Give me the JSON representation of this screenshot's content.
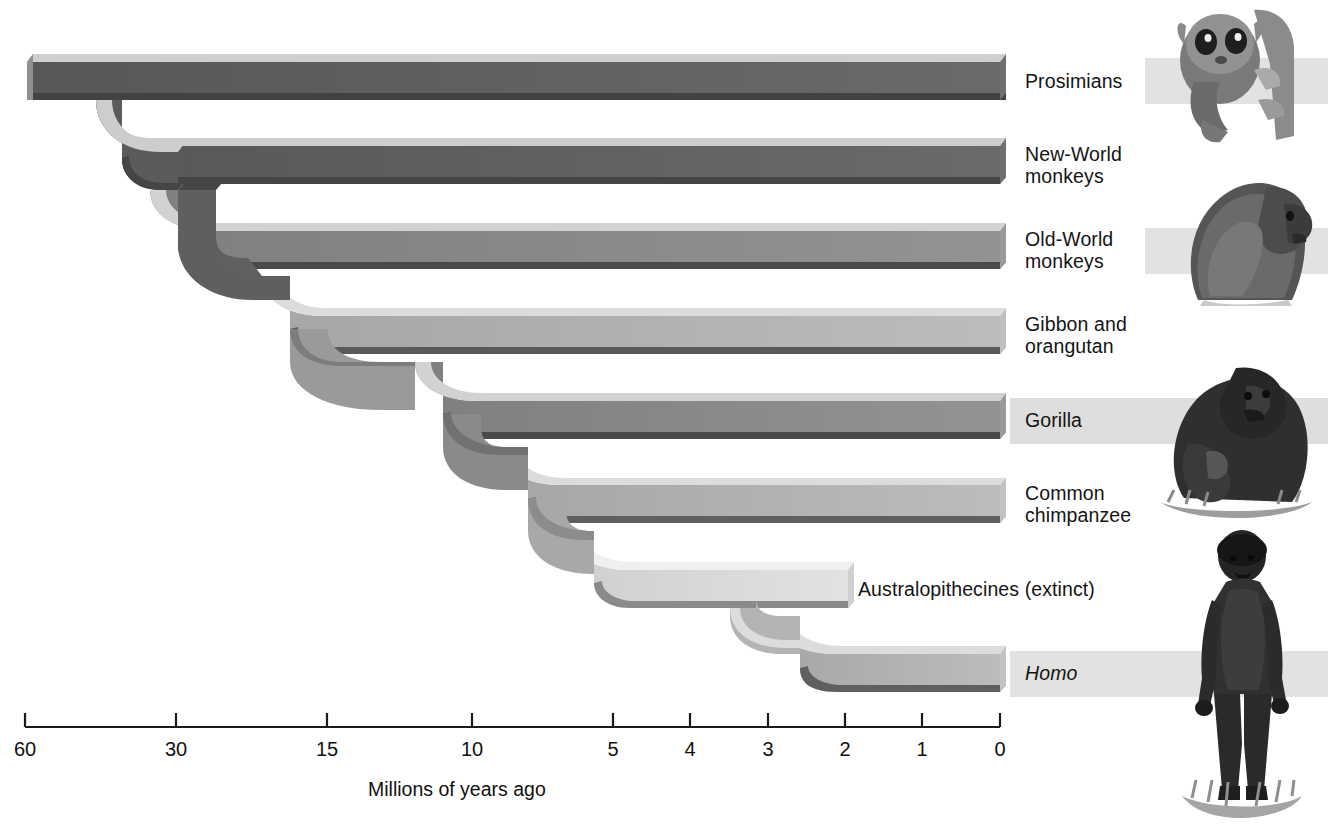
{
  "figure": {
    "kind": "primate-phylogeny-cladogram",
    "axis": {
      "title": "Millions of years ago",
      "ticks": [
        {
          "label": "60",
          "value": 60,
          "x": 25
        },
        {
          "label": "30",
          "value": 30,
          "x": 176
        },
        {
          "label": "15",
          "value": 15,
          "x": 327
        },
        {
          "label": "10",
          "value": 10,
          "x": 472
        },
        {
          "label": "5",
          "value": 5,
          "x": 613
        },
        {
          "label": "4",
          "value": 4,
          "x": 690
        },
        {
          "label": "3",
          "value": 3,
          "x": 768
        },
        {
          "label": "2",
          "value": 2,
          "x": 845
        },
        {
          "label": "1",
          "value": 1,
          "x": 922
        },
        {
          "label": "0",
          "value": 0,
          "x": 1000
        }
      ],
      "line_y": 727,
      "tick_length": 14
    },
    "branches": [
      {
        "id": "prosimians",
        "label": "Prosimians",
        "split_mya": 60,
        "tone": "dark",
        "row_y": 62,
        "start_x": 27,
        "end_x": 1000
      },
      {
        "id": "new-world-monkeys",
        "label": "New-World\nmonkeys",
        "split_mya": 38,
        "tone": "dark",
        "row_y": 146,
        "start_x": 140,
        "end_x": 1000
      },
      {
        "id": "old-world-monkeys",
        "label": "Old-World\nmonkeys",
        "split_mya": 25,
        "tone": "mid",
        "row_y": 231,
        "start_x": 255,
        "end_x": 1000
      },
      {
        "id": "gibbon-orangutan",
        "label": "Gibbon and\norangutan",
        "split_mya": 14,
        "tone": "light",
        "row_y": 316,
        "start_x": 360,
        "end_x": 1000
      },
      {
        "id": "gorilla",
        "label": "Gorilla",
        "split_mya": 8,
        "tone": "mid",
        "row_y": 401,
        "start_x": 513,
        "end_x": 1000
      },
      {
        "id": "common-chimpanzee",
        "label": "Common\nchimpanzee",
        "split_mya": 6,
        "tone": "light",
        "row_y": 485,
        "start_x": 588,
        "end_x": 1000
      },
      {
        "id": "australopithecines",
        "label": "Australopithecines (extinct)",
        "split_mya": 4.5,
        "tone": "palest",
        "row_y": 570,
        "start_x": 650,
        "end_x": 848,
        "extinct": true
      },
      {
        "id": "homo",
        "label": "Homo",
        "split_mya": 2.5,
        "tone": "light",
        "row_y": 654,
        "start_x": 778,
        "end_x": 1000,
        "italic": true
      }
    ],
    "labels": {
      "x": 1025,
      "australopithecines_x": 858
    },
    "artwork": [
      {
        "name": "tarsier-prosimian-illustration",
        "row": "prosimians"
      },
      {
        "name": "baboon-old-world-monkey-illustration",
        "row": "old-world-monkeys"
      },
      {
        "name": "gorilla-illustration",
        "row": "gorilla"
      },
      {
        "name": "early-human-homo-illustration",
        "row": "homo"
      }
    ],
    "colors": {
      "background": "#ffffff",
      "ribbon_dark": "#5e5e5e",
      "ribbon_mid": "#8b8b8b",
      "ribbon_light": "#b4b4b4",
      "ribbon_palest": "#dcdcdc",
      "edge_top": "#d7d7d7",
      "edge_bottom": "#3f3f3f",
      "text": "#141414",
      "scan_band": "#dededc"
    }
  }
}
